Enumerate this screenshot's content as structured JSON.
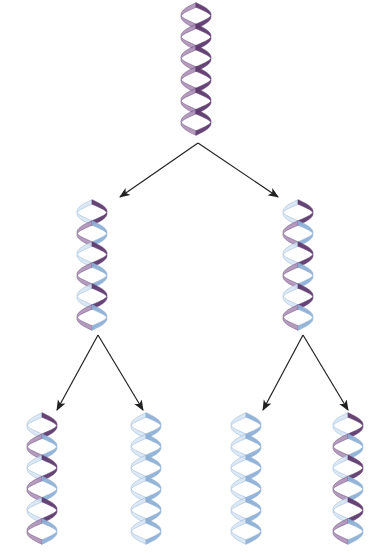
{
  "diagram": {
    "title": "",
    "colors": {
      "parental_strand": "#5e3a6e",
      "parental_strand_light": "#a98bb5",
      "new_strand": "#8fb0d6",
      "new_strand_light": "#d6e4f3",
      "arrow": "#222222",
      "background": "#ffffff"
    },
    "generations": [
      {
        "level": 0,
        "label": "",
        "helices": [
          {
            "id": "parent",
            "x": 178,
            "y": 5,
            "w": 36,
            "h": 128,
            "strand_a": "parental",
            "strand_b": "parental"
          }
        ]
      },
      {
        "level": 1,
        "label": "",
        "helices": [
          {
            "id": "gen1-left",
            "x": 74,
            "y": 202,
            "w": 36,
            "h": 126,
            "strand_a": "parental",
            "strand_b": "new"
          },
          {
            "id": "gen1-right",
            "x": 280,
            "y": 202,
            "w": 36,
            "h": 126,
            "strand_a": "parental",
            "strand_b": "new"
          }
        ]
      },
      {
        "level": 2,
        "label": "",
        "helices": [
          {
            "id": "gen2-1",
            "x": 24,
            "y": 415,
            "w": 36,
            "h": 127,
            "strand_a": "parental",
            "strand_b": "new"
          },
          {
            "id": "gen2-2",
            "x": 128,
            "y": 415,
            "w": 36,
            "h": 127,
            "strand_a": "new",
            "strand_b": "new"
          },
          {
            "id": "gen2-3",
            "x": 228,
            "y": 415,
            "w": 36,
            "h": 127,
            "strand_a": "new",
            "strand_b": "new"
          },
          {
            "id": "gen2-4",
            "x": 330,
            "y": 415,
            "w": 36,
            "h": 127,
            "strand_a": "parental",
            "strand_b": "new"
          }
        ]
      }
    ],
    "arrows": [
      {
        "id": "arrow-parent-to-left",
        "from": [
          198,
          143
        ],
        "to": [
          120,
          197
        ]
      },
      {
        "id": "arrow-parent-to-right",
        "from": [
          198,
          143
        ],
        "to": [
          278,
          197
        ]
      },
      {
        "id": "arrow-left-to-1",
        "from": [
          98,
          335
        ],
        "to": [
          57,
          410
        ]
      },
      {
        "id": "arrow-left-to-2",
        "from": [
          98,
          335
        ],
        "to": [
          143,
          410
        ]
      },
      {
        "id": "arrow-right-to-3",
        "from": [
          303,
          335
        ],
        "to": [
          263,
          410
        ]
      },
      {
        "id": "arrow-right-to-4",
        "from": [
          303,
          335
        ],
        "to": [
          348,
          410
        ]
      }
    ]
  }
}
